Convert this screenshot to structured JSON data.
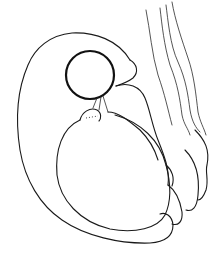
{
  "figure": {
    "type": "line-drawing",
    "background_color": "#ffffff",
    "stroke_color": "#1a1a1a"
  }
}
